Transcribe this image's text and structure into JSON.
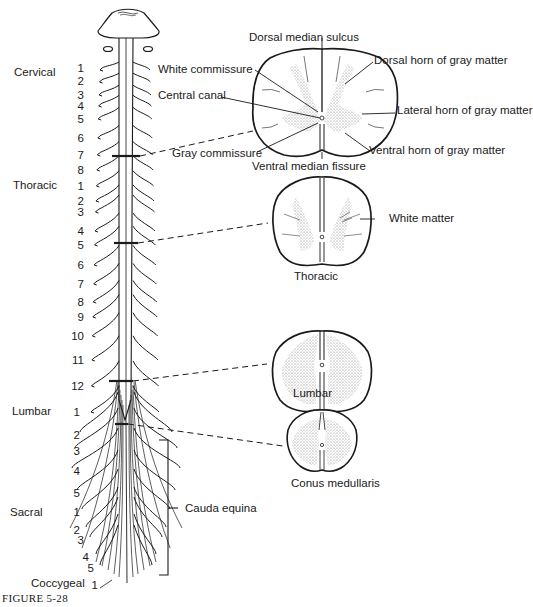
{
  "figure": {
    "caption": "FIGURE 5-28"
  },
  "regions": [
    {
      "name": "Cervical",
      "numbers": [
        "1",
        "2",
        "3",
        "4",
        "5",
        "6",
        "7",
        "8"
      ]
    },
    {
      "name": "Thoracic",
      "numbers": [
        "1",
        "2",
        "3",
        "4",
        "5",
        "6",
        "7",
        "8",
        "9",
        "10",
        "11",
        "12"
      ]
    },
    {
      "name": "Lumbar",
      "numbers": [
        "1",
        "2",
        "3",
        "4",
        "5"
      ]
    },
    {
      "name": "Sacral",
      "numbers": [
        "1",
        "2",
        "3",
        "4",
        "5"
      ]
    },
    {
      "name": "Coccygeal",
      "numbers": [
        "1"
      ]
    }
  ],
  "cervical_section": {
    "labels": {
      "dorsal_median_sulcus": "Dorsal median sulcus",
      "white_commissure": "White commissure",
      "central_canal": "Central canal",
      "gray_commissure": "Gray commissure",
      "dorsal_horn": "Dorsal horn of gray matter",
      "lateral_horn": "Lateral horn of gray matter",
      "ventral_horn": "Ventral horn of gray matter",
      "ventral_median_fissure": "Ventral median fissure"
    }
  },
  "thoracic_section": {
    "white_matter": "White matter",
    "title": "Thoracic"
  },
  "lumbar_section": {
    "title": "Lumbar"
  },
  "conus_section": {
    "title": "Conus medullaris"
  },
  "cauda_equina": {
    "label": "Cauda equina"
  },
  "colors": {
    "line": "#1a1a1a",
    "gray_matter": "#d9d9d9",
    "background": "#ffffff"
  }
}
